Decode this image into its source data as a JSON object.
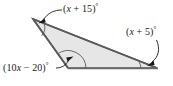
{
  "figure": {
    "type": "triangle-angle-diagram",
    "background_color": "#ffffff",
    "fill_color": "#e6e6e6",
    "stroke_color": "#555555",
    "leader_color": "#1a1a1a",
    "text_color": "#1a1a1a",
    "vertices": {
      "apex_left": {
        "x": 33,
        "y": 19
      },
      "bottom_left": {
        "x": 68,
        "y": 68
      },
      "bottom_right": {
        "x": 157,
        "y": 68
      }
    },
    "labels": {
      "top": {
        "full_text": "(x + 15)°",
        "prefix": "(",
        "variable": "x",
        "operator": " + ",
        "constant": "15)",
        "degree": "°",
        "target_vertex": "apex_left"
      },
      "right": {
        "full_text": "(x + 5)°",
        "prefix": "(",
        "variable": "x",
        "operator": " + ",
        "constant": "5)",
        "degree": "°",
        "target_vertex": "bottom_right"
      },
      "bottom": {
        "full_text": "(10x − 20)°",
        "prefix": "(10",
        "variable": "x",
        "operator": " − ",
        "constant": "20)",
        "degree": "°",
        "target_vertex": "bottom_left"
      }
    }
  }
}
